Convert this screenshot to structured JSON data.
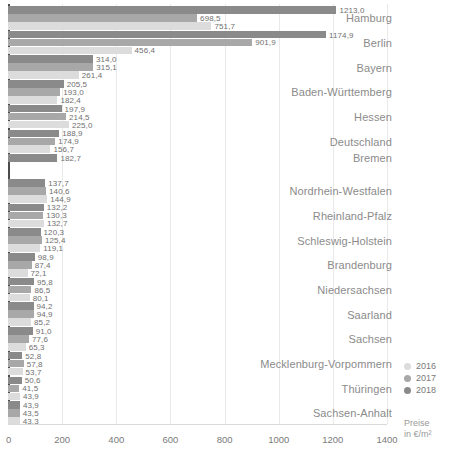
{
  "chart_data": {
    "type": "bar",
    "orientation": "horizontal",
    "title": "",
    "xlabel": "Preise in €/m²",
    "ylabel": "",
    "xlim": [
      0,
      1400
    ],
    "xticks": [
      "0",
      "200",
      "400",
      "600",
      "800",
      "1000",
      "1200",
      "1400"
    ],
    "xtick_values": [
      0,
      200,
      400,
      600,
      800,
      1000,
      1200,
      1400
    ],
    "grid": true,
    "legend_position": "right-bottom",
    "series": [
      {
        "name": "2016",
        "color": "#dcdcdc"
      },
      {
        "name": "2017",
        "color": "#a8a8a8"
      },
      {
        "name": "2018",
        "color": "#8a8a8a"
      }
    ],
    "categories": [
      "Hamburg",
      "Berlin",
      "Bayern",
      "Baden-Württemberg",
      "Hessen",
      "Deutschland",
      "Bremen",
      "Nordrhein-Westfalen",
      "Rheinland-Pfalz",
      "Schleswig-Holstein",
      "Brandenburg",
      "Niedersachsen",
      "Saarland",
      "Sachsen",
      "Mecklenburg-Vorpommern",
      "Thüringen",
      "Sachsen-Anhalt"
    ],
    "groups": [
      {
        "category": "Hamburg",
        "bars": [
          {
            "year": "2018",
            "value": 1213.0,
            "label": "1213,0"
          },
          {
            "year": "2017",
            "value": 698.5,
            "label": "698,5"
          },
          {
            "year": "2016",
            "value": 751.7,
            "label": "751,7"
          }
        ]
      },
      {
        "category": "Berlin",
        "bars": [
          {
            "year": "2018",
            "value": 1174.9,
            "label": "1174,9"
          },
          {
            "year": "2017",
            "value": 901.9,
            "label": "901,9"
          },
          {
            "year": "2016",
            "value": 456.4,
            "label": "456,4"
          }
        ]
      },
      {
        "category": "Bayern",
        "bars": [
          {
            "year": "2018",
            "value": 314.0,
            "label": "314,0"
          },
          {
            "year": "2017",
            "value": 315.1,
            "label": "315,1"
          },
          {
            "year": "2016",
            "value": 261.4,
            "label": "261,4"
          }
        ]
      },
      {
        "category": "Baden-Württemberg",
        "bars": [
          {
            "year": "2018",
            "value": 205.5,
            "label": "205,5"
          },
          {
            "year": "2017",
            "value": 193.0,
            "label": "193,0"
          },
          {
            "year": "2016",
            "value": 182.4,
            "label": "182,4"
          }
        ]
      },
      {
        "category": "Hessen",
        "bars": [
          {
            "year": "2018",
            "value": 197.9,
            "label": "197,9"
          },
          {
            "year": "2017",
            "value": 214.5,
            "label": "214,5"
          },
          {
            "year": "2016",
            "value": 225.0,
            "label": "225,0"
          }
        ]
      },
      {
        "category": "Deutschland",
        "bars": [
          {
            "year": "2018",
            "value": 188.9,
            "label": "188,9"
          },
          {
            "year": "2017",
            "value": 174.9,
            "label": "174,9"
          },
          {
            "year": "2016",
            "value": 156.7,
            "label": "156,7"
          }
        ]
      },
      {
        "category": "Bremen",
        "bars": [
          {
            "year": "2018",
            "value": 182.7,
            "label": "182,7"
          }
        ]
      },
      {
        "category": "Nordrhein-Westfalen",
        "bars": [
          {
            "year": "2018",
            "value": 137.7,
            "label": "137,7"
          },
          {
            "year": "2017",
            "value": 140.6,
            "label": "140,6"
          },
          {
            "year": "2016",
            "value": 144.9,
            "label": "144,9"
          }
        ]
      },
      {
        "category": "Rheinland-Pfalz",
        "bars": [
          {
            "year": "2018",
            "value": 132.2,
            "label": "132,2"
          },
          {
            "year": "2017",
            "value": 130.3,
            "label": "130,3"
          },
          {
            "year": "2016",
            "value": 132.7,
            "label": "132,7"
          }
        ]
      },
      {
        "category": "Schleswig-Holstein",
        "bars": [
          {
            "year": "2018",
            "value": 120.3,
            "label": "120,3"
          },
          {
            "year": "2017",
            "value": 125.4,
            "label": "125,4"
          },
          {
            "year": "2016",
            "value": 119.1,
            "label": "119,1"
          }
        ]
      },
      {
        "category": "Brandenburg",
        "bars": [
          {
            "year": "2018",
            "value": 98.9,
            "label": "98,9"
          },
          {
            "year": "2017",
            "value": 87.4,
            "label": "87,4"
          },
          {
            "year": "2016",
            "value": 72.1,
            "label": "72,1"
          }
        ]
      },
      {
        "category": "Niedersachsen",
        "bars": [
          {
            "year": "2018",
            "value": 95.8,
            "label": "95,8"
          },
          {
            "year": "2017",
            "value": 86.5,
            "label": "86,5"
          },
          {
            "year": "2016",
            "value": 80.1,
            "label": "80,1"
          }
        ]
      },
      {
        "category": "Saarland",
        "bars": [
          {
            "year": "2018",
            "value": 94.2,
            "label": "94,2"
          },
          {
            "year": "2017",
            "value": 94.9,
            "label": "94,9"
          },
          {
            "year": "2016",
            "value": 85.2,
            "label": "85,2"
          }
        ]
      },
      {
        "category": "Sachsen",
        "bars": [
          {
            "year": "2018",
            "value": 91.0,
            "label": "91,0"
          },
          {
            "year": "2017",
            "value": 77.6,
            "label": "77,6"
          },
          {
            "year": "2016",
            "value": 65.3,
            "label": "65,3"
          }
        ]
      },
      {
        "category": "Mecklenburg-Vorpommern",
        "bars": [
          {
            "year": "2018",
            "value": 52.8,
            "label": "52,8"
          },
          {
            "year": "2017",
            "value": 57.8,
            "label": "57,8"
          },
          {
            "year": "2016",
            "value": 53.7,
            "label": "53,7"
          }
        ]
      },
      {
        "category": "Thüringen",
        "bars": [
          {
            "year": "2018",
            "value": 50.6,
            "label": "50,6"
          },
          {
            "year": "2017",
            "value": 41.5,
            "label": "41,5"
          },
          {
            "year": "2016",
            "value": 43.9,
            "label": "43,9"
          }
        ]
      },
      {
        "category": "Sachsen-Anhalt",
        "bars": [
          {
            "year": "2018",
            "value": 43.9,
            "label": "43,9"
          },
          {
            "year": "2017",
            "value": 43.5,
            "label": "43,5"
          },
          {
            "year": "2016",
            "value": 43.3,
            "label": "43,3"
          }
        ]
      }
    ]
  },
  "legend": {
    "items": [
      {
        "label": "2016",
        "color": "#dcdcdc"
      },
      {
        "label": "2017",
        "color": "#a8a8a8"
      },
      {
        "label": "2018",
        "color": "#8a8a8a"
      }
    ]
  },
  "axis_title": {
    "line1": "Preise",
    "line2": "in €/m²"
  }
}
